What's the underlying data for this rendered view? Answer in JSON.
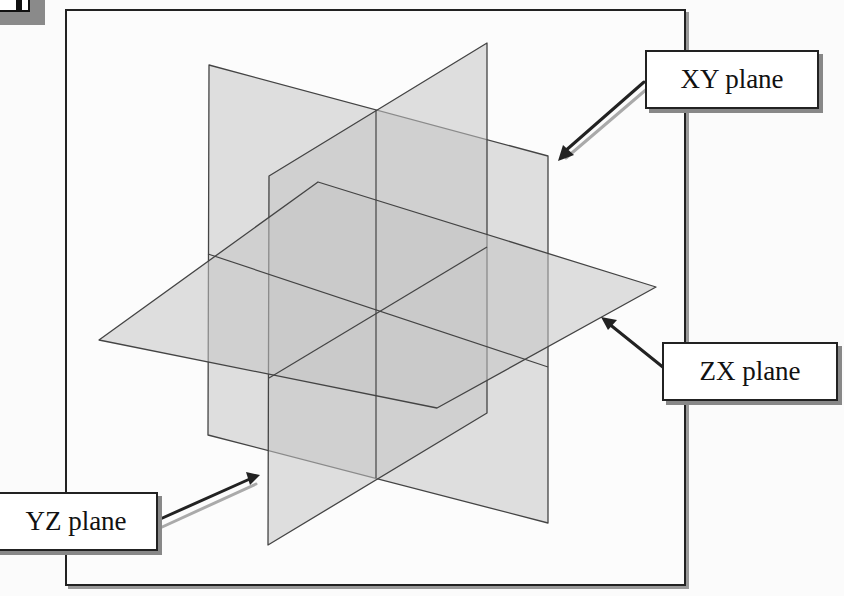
{
  "labels": {
    "xy": "XY plane",
    "zx": "ZX plane",
    "yz": "YZ plane"
  },
  "colors": {
    "plane_fill": "#c8c8c8",
    "plane_edge": "#444444",
    "frame": "#222222",
    "arrow": "#222222",
    "arrow_shadow": "#aaaaaa"
  }
}
